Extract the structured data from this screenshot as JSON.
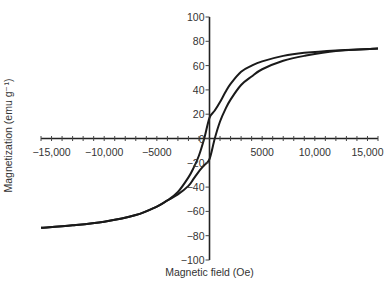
{
  "chart_data": {
    "type": "line",
    "title": "",
    "xlabel": "Magnetic field (Oe)",
    "ylabel": "Magnetization (emu g⁻¹)",
    "xlim": [
      -16000,
      16000
    ],
    "ylim": [
      -100,
      100
    ],
    "grid": false,
    "legend": "none",
    "x_ticks": [
      -15000,
      -10000,
      -5000,
      5000,
      10000,
      15000
    ],
    "x_tick_labels": [
      "−15,000",
      "−10,000",
      "−5000",
      "5000",
      "10,000",
      "15,000"
    ],
    "x_minor_tick_step": 1000,
    "y_ticks": [
      100,
      80,
      60,
      40,
      20,
      0,
      -20,
      -40,
      -60,
      -80,
      -100
    ],
    "y_tick_labels": [
      "100",
      "80",
      "60",
      "40",
      "20",
      "0",
      "−20",
      "−40",
      "−60",
      "−80",
      "−100"
    ],
    "series": [
      {
        "name": "descending branch",
        "x": [
          16000,
          12000,
          9000,
          7000,
          5000,
          4000,
          3000,
          2000,
          1500,
          1000,
          500,
          0,
          -500,
          -1000,
          -1500,
          -2000,
          -3000,
          -4000,
          -5000,
          -7000,
          -10000,
          -13000,
          -16000
        ],
        "y": [
          74,
          72.5,
          70.5,
          68,
          63.5,
          60,
          55,
          45,
          38,
          30,
          23,
          17,
          0,
          -14,
          -24,
          -32,
          -44,
          -51,
          -56,
          -63,
          -68.5,
          -71.5,
          -73.5
        ]
      },
      {
        "name": "ascending branch",
        "x": [
          -16000,
          -13000,
          -10000,
          -7000,
          -5000,
          -4000,
          -3000,
          -2000,
          -1500,
          -1000,
          -500,
          0,
          500,
          1000,
          1500,
          2000,
          3000,
          4000,
          5000,
          7000,
          9000,
          12000,
          16000
        ],
        "y": [
          -73.5,
          -71.5,
          -68.5,
          -63,
          -56,
          -51,
          -46,
          -39,
          -33,
          -27,
          -22,
          -17,
          0,
          14,
          24,
          32,
          44,
          51,
          57,
          64,
          68,
          72,
          74
        ]
      }
    ],
    "annotations": []
  }
}
